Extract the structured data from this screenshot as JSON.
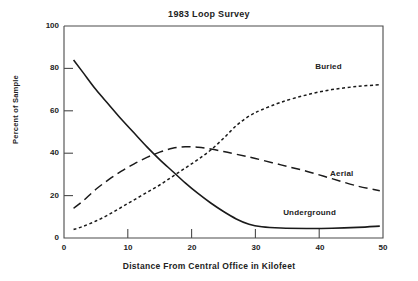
{
  "chart_data": {
    "type": "line",
    "title": "1983 Loop Survey",
    "xlabel": "Distance From Central Office in Kilofeet",
    "ylabel": "Percent of Sample",
    "xlim": [
      0,
      50
    ],
    "ylim": [
      0,
      100
    ],
    "xticks": [
      "0",
      "10",
      "20",
      "30",
      "40",
      "50"
    ],
    "yticks": [
      "0",
      "20",
      "40",
      "60",
      "80",
      "100"
    ],
    "grid": false,
    "legend_position": "inline-right",
    "series": [
      {
        "name": "Underground",
        "style": "solid",
        "color": "#1a1a1a",
        "label_x": 38.5,
        "label_y": 11.5,
        "x": [
          1.5,
          3,
          5,
          7,
          9,
          11,
          13,
          15,
          17,
          19,
          21,
          23,
          25,
          27,
          29,
          31,
          34,
          38,
          42,
          46,
          49.5
        ],
        "y": [
          84,
          78,
          70,
          63,
          56,
          49.5,
          43,
          37,
          31.5,
          26,
          21,
          16.5,
          12.5,
          9,
          6.5,
          5.3,
          4.7,
          4.5,
          4.6,
          5.0,
          5.6
        ]
      },
      {
        "name": "Aerial",
        "style": "dashed",
        "color": "#1a1a1a",
        "label_x": 43.5,
        "label_y": 29.5,
        "x": [
          1.5,
          3,
          5,
          7,
          9,
          11,
          13,
          15,
          17,
          19,
          21,
          23,
          25,
          27,
          30,
          34,
          38,
          42,
          46,
          49.5
        ],
        "y": [
          14,
          17.5,
          23,
          27.5,
          31.5,
          35,
          38,
          40.5,
          42.3,
          43,
          42.8,
          42,
          40.8,
          39.5,
          37.5,
          34.5,
          31.5,
          28,
          24.5,
          22.3
        ]
      },
      {
        "name": "Buried",
        "style": "dotted",
        "color": "#1a1a1a",
        "label_x": 41.5,
        "label_y": 80,
        "x": [
          1.5,
          3,
          5,
          7,
          9,
          11,
          13,
          15,
          17,
          19,
          21,
          23,
          25,
          27,
          29,
          31,
          34,
          38,
          42,
          46,
          49.5
        ],
        "y": [
          4,
          5.5,
          8,
          11,
          14.5,
          18,
          21.5,
          25,
          29,
          33,
          37,
          41.5,
          47,
          53,
          57.5,
          60.5,
          64,
          67.5,
          70,
          71.5,
          72.3
        ]
      }
    ]
  }
}
